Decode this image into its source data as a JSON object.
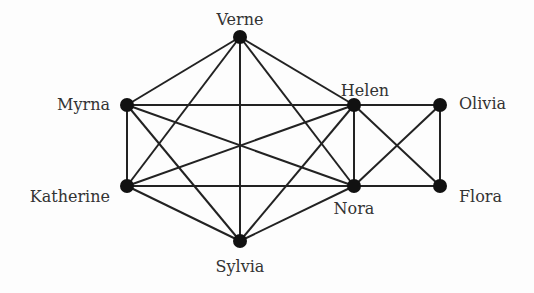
{
  "diagram": {
    "type": "graph",
    "nodes": [
      {
        "id": "verne",
        "label": "Verne",
        "x": 240,
        "y": 37,
        "lx": 240,
        "ly": 25,
        "anchor": "middle"
      },
      {
        "id": "myrna",
        "label": "Myrna",
        "x": 127,
        "y": 105,
        "lx": 110,
        "ly": 110,
        "anchor": "end"
      },
      {
        "id": "helen",
        "label": "Helen",
        "x": 354,
        "y": 105,
        "lx": 365,
        "ly": 96,
        "anchor": "middle"
      },
      {
        "id": "olivia",
        "label": "Olivia",
        "x": 440,
        "y": 105,
        "lx": 459,
        "ly": 109,
        "anchor": "start"
      },
      {
        "id": "katherine",
        "label": "Katherine",
        "x": 127,
        "y": 186,
        "lx": 110,
        "ly": 202,
        "anchor": "end"
      },
      {
        "id": "nora",
        "label": "Nora",
        "x": 354,
        "y": 186,
        "lx": 354,
        "ly": 214,
        "anchor": "middle"
      },
      {
        "id": "flora",
        "label": "Flora",
        "x": 440,
        "y": 186,
        "lx": 459,
        "ly": 202,
        "anchor": "start"
      },
      {
        "id": "sylvia",
        "label": "Sylvia",
        "x": 240,
        "y": 241,
        "lx": 240,
        "ly": 272,
        "anchor": "middle"
      }
    ],
    "edges": [
      [
        "verne",
        "myrna"
      ],
      [
        "verne",
        "katherine"
      ],
      [
        "verne",
        "sylvia"
      ],
      [
        "verne",
        "helen"
      ],
      [
        "verne",
        "nora"
      ],
      [
        "myrna",
        "helen"
      ],
      [
        "myrna",
        "katherine"
      ],
      [
        "myrna",
        "nora"
      ],
      [
        "myrna",
        "sylvia"
      ],
      [
        "katherine",
        "helen"
      ],
      [
        "katherine",
        "nora"
      ],
      [
        "katherine",
        "sylvia"
      ],
      [
        "sylvia",
        "helen"
      ],
      [
        "sylvia",
        "nora"
      ],
      [
        "helen",
        "nora"
      ],
      [
        "helen",
        "olivia"
      ],
      [
        "helen",
        "flora"
      ],
      [
        "olivia",
        "nora"
      ],
      [
        "olivia",
        "flora"
      ],
      [
        "nora",
        "flora"
      ]
    ],
    "colors": {
      "edge": "#222222",
      "node": "#111111",
      "label": "#333333"
    }
  }
}
